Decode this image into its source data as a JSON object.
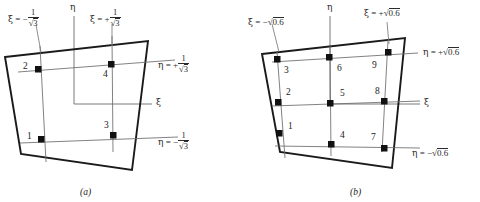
{
  "figure": {
    "caption_a": "(a)",
    "caption_b": "(b)",
    "axis_xi": "ξ",
    "axis_eta": "η"
  },
  "panel_a": {
    "caption": "(a)",
    "scheme": "2 x 2 Gauss quadrature",
    "labels": {
      "xi_neg": {
        "sym": "ξ",
        "eq": "=",
        "sign": "−",
        "numer": "1",
        "denom_radicand": "3"
      },
      "xi_pos": {
        "sym": "ξ",
        "eq": "=",
        "sign": "+",
        "numer": "1",
        "denom_radicand": "3"
      },
      "eta_pos": {
        "sym": "η",
        "eq": "=",
        "sign": "+",
        "numer": "1",
        "denom_radicand": "3"
      },
      "eta_neg": {
        "sym": "η",
        "eq": "=",
        "sign": "−",
        "numer": "1",
        "denom_radicand": "3"
      },
      "xi_axis": "ξ",
      "eta_axis": "η"
    },
    "points": [
      {
        "id": "1",
        "label": "1"
      },
      {
        "id": "2",
        "label": "2"
      },
      {
        "id": "3",
        "label": "3"
      },
      {
        "id": "4",
        "label": "4"
      }
    ]
  },
  "panel_b": {
    "caption": "(b)",
    "scheme": "3 x 3 Gauss quadrature",
    "labels": {
      "xi_neg": {
        "sym": "ξ",
        "eq": "=",
        "sign": "−",
        "radicand": "0.6"
      },
      "xi_pos": {
        "sym": "ξ",
        "eq": "=",
        "sign": "+",
        "radicand": "0.6"
      },
      "eta_pos": {
        "sym": "η",
        "eq": "=",
        "sign": "+",
        "radicand": "0.6"
      },
      "eta_neg": {
        "sym": "η",
        "eq": "=",
        "sign": "−",
        "radicand": "0.6"
      },
      "xi_axis": "ξ",
      "eta_axis": "η"
    },
    "points": [
      {
        "id": "1",
        "label": "1"
      },
      {
        "id": "2",
        "label": "2"
      },
      {
        "id": "3",
        "label": "3"
      },
      {
        "id": "4",
        "label": "4"
      },
      {
        "id": "5",
        "label": "5"
      },
      {
        "id": "6",
        "label": "6"
      },
      {
        "id": "7",
        "label": "7"
      },
      {
        "id": "8",
        "label": "8"
      },
      {
        "id": "9",
        "label": "9"
      }
    ]
  },
  "colors": {
    "element_outline": "#1a1a1a",
    "grid_line": "#6b6b6b",
    "leader_line": "#7a7a7a",
    "marker": "#111111",
    "text": "#2b2b2b",
    "background": "#ffffff"
  }
}
